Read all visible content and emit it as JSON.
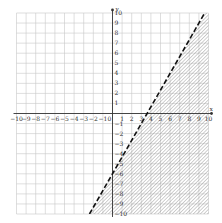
{
  "chart_data": {
    "type": "inequality-graph",
    "title": "",
    "xlabel": "x",
    "ylabel": "y",
    "xlim": [
      -10,
      10
    ],
    "ylim": [
      -10,
      10
    ],
    "grid": true,
    "x_ticks": [
      -10,
      -9,
      -8,
      -7,
      -6,
      -5,
      -4,
      -3,
      -2,
      -1,
      1,
      2,
      3,
      4,
      5,
      6,
      7,
      8,
      9,
      10
    ],
    "y_ticks": [
      -10,
      -9,
      -8,
      -7,
      -6,
      -5,
      -4,
      -3,
      -2,
      -1,
      1,
      2,
      3,
      4,
      5,
      6,
      7,
      8,
      9,
      10
    ],
    "origin_label": "0",
    "boundary": {
      "equation": "y = (5/3)x - 6",
      "slope": 1.6667,
      "intercept": -6,
      "style": "dashed",
      "points": [
        [
          -2.4,
          -10
        ],
        [
          0,
          -6
        ],
        [
          3.6,
          0
        ],
        [
          9.6,
          10
        ]
      ]
    },
    "shaded_region": "below-right of line (y < (5/3)x - 6)",
    "shading_style": "diagonal-hatch"
  },
  "colors": {
    "grid": "#c8c8c8",
    "axis": "#333333",
    "line": "#111111",
    "hatch": "#777777"
  }
}
